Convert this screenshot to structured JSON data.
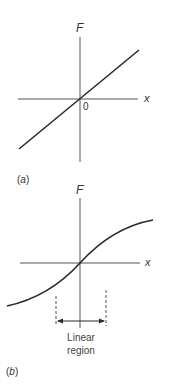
{
  "panel_a": {
    "caption_open": "(",
    "caption_letter": "a",
    "caption_close": ")",
    "y_label": "F",
    "x_label": "x",
    "origin_label": "0",
    "curve": "linear"
  },
  "panel_b": {
    "caption_open": "(",
    "caption_letter": "b",
    "caption_close": ")",
    "y_label": "F",
    "x_label": "x",
    "curve": "sigmoid",
    "region_line1": "Linear",
    "region_line2": "region"
  },
  "colors": {
    "line": "#2a2a2a",
    "axis": "#555555"
  }
}
